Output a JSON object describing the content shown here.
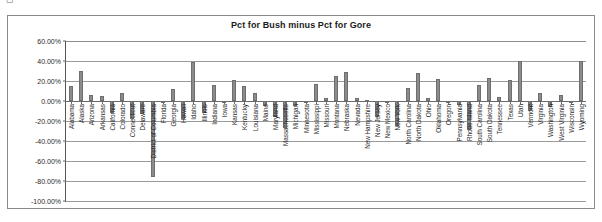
{
  "caption_fragment": "◻",
  "chart_data": {
    "type": "bar",
    "title": "Pct for Bush minus Pct for Gore",
    "xlabel": "",
    "ylabel": "",
    "ylim": [
      -100,
      60
    ],
    "ytick_step": 20,
    "grid": true,
    "legend": "none",
    "value_suffix": "%",
    "ytick_labels": [
      "60.00%",
      "40.00%",
      "20.00%",
      "0.00%",
      "-20.00%",
      "-40.00%",
      "-60.00%",
      "-80.00%",
      "-100.00%"
    ],
    "ytick_values": [
      60,
      40,
      20,
      0,
      -20,
      -40,
      -60,
      -80,
      -100
    ],
    "categories": [
      "Alabama",
      "Alaska",
      "Arizona",
      "Arkansas",
      "California",
      "Colorado",
      "Connecticut",
      "Delaware",
      "District of Columbia",
      "Florida",
      "Georgia",
      "Hawaii",
      "Idaho",
      "Illinois",
      "Indiana",
      "Iowa",
      "Kansas",
      "Kentucky",
      "Louisiana",
      "Maine",
      "Maryland",
      "Massachusetts",
      "Michigan",
      "Minnesota",
      "Mississippi",
      "Missouri",
      "Montana",
      "Nebraska",
      "Nevada",
      "New Hampshire",
      "New Jersey",
      "New Mexico",
      "New York",
      "North Carolina",
      "North Dakota",
      "Ohio",
      "Oklahoma",
      "Oregon",
      "Pennsylvania",
      "Rhode Island",
      "South Carolina",
      "South Dakota",
      "Tennessee",
      "Texas",
      "Utah",
      "Vermont",
      "Virginia",
      "Washington",
      "West Virginia",
      "Wisconsin",
      "Wyoming"
    ],
    "values": [
      14.9,
      30.0,
      6.3,
      5.4,
      -11.8,
      8.4,
      -17.5,
      -13.1,
      -76.2,
      0.0,
      11.7,
      -18.3,
      39.5,
      -12.4,
      15.7,
      -0.3,
      20.8,
      15.1,
      7.7,
      -5.1,
      -16.2,
      -27.3,
      -5.1,
      -2.4,
      16.9,
      3.3,
      25.1,
      29.0,
      3.5,
      1.3,
      -15.8,
      -0.1,
      -25.0,
      12.8,
      27.6,
      3.5,
      21.9,
      -0.4,
      -4.2,
      -29.1,
      16.0,
      22.7,
      3.9,
      21.3,
      40.5,
      -9.9,
      8.0,
      -5.6,
      6.3,
      -0.2,
      40.1
    ]
  }
}
